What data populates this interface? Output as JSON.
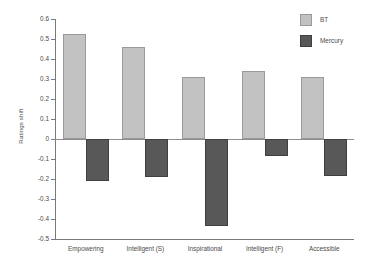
{
  "chart_data": {
    "type": "bar",
    "title": "",
    "xlabel": "",
    "ylabel": "Ratings shift",
    "categories": [
      "Empowering",
      "Intelligent (S)",
      "Inspirational",
      "Intelligent (F)",
      "Accessible"
    ],
    "series": [
      {
        "name": "BT",
        "color": "#c2c2c2",
        "values": [
          0.525,
          0.46,
          0.31,
          0.34,
          0.31
        ]
      },
      {
        "name": "Mercury",
        "color": "#585858",
        "values": [
          -0.21,
          -0.19,
          -0.435,
          -0.085,
          -0.185
        ]
      }
    ],
    "ylim": [
      -0.5,
      0.6
    ],
    "ytick_labels": [
      "0.6",
      "0.5",
      "0.4",
      "0.3",
      "0.2",
      "0.1",
      "0",
      "-0.1",
      "-0.2",
      "-0.3",
      "-0.4",
      "-0.5"
    ],
    "ytick_values": [
      0.6,
      0.5,
      0.4,
      0.3,
      0.2,
      0.1,
      0,
      -0.1,
      -0.2,
      -0.3,
      -0.4,
      -0.5
    ],
    "ytick_step": 0.1,
    "grid": false,
    "zero_line": true,
    "legend_position": "top-right",
    "legend_entries": [
      "BT",
      "Mercury"
    ]
  }
}
